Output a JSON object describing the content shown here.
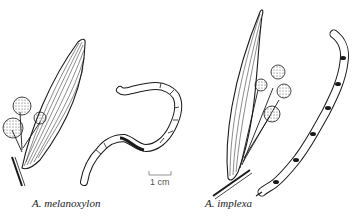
{
  "figure": {
    "background": "#ffffff",
    "ink_color": "#1a1a1a",
    "specimens": [
      {
        "label": "A. melanoxylon",
        "parts": [
          "phyllode-leaf",
          "flower-heads",
          "seed-pod"
        ]
      },
      {
        "label": "A. implexa",
        "parts": [
          "phyllode-leaf",
          "flower-heads",
          "seed-pod"
        ]
      }
    ],
    "scale_bar": {
      "label": "1 cm"
    }
  }
}
